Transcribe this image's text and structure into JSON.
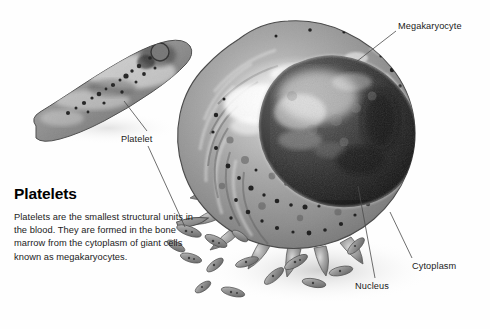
{
  "figure": {
    "kind": "biology-illustration",
    "background_color": "#fefefe",
    "line_color": "#4a4a4a",
    "text_color": "#1a1a1a"
  },
  "labels": {
    "megakaryocyte": "Megakaryocyte",
    "platelet": "Platelet",
    "cytoplasm": "Cytoplasm",
    "nucleus": "Nucleus"
  },
  "caption": {
    "title": "Platelets",
    "body": "Platelets are the smallest structural units in the blood. They are formed in the bone marrow from the cytoplasm of giant cells known as megakaryocytes."
  },
  "structures": {
    "large_platelet": "large-platelet-cell",
    "megakaryocyte_cell": "megakaryocyte-cell",
    "nucleus_region": "megakaryocyte-nucleus",
    "cytoplasm_region": "megakaryocyte-cytoplasm",
    "small_platelets_count": 14
  }
}
